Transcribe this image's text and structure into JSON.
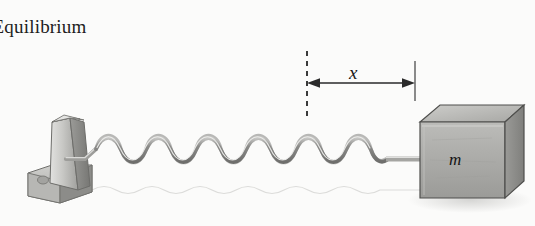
{
  "diagram": {
    "background_color": "#fbfbfa",
    "labels": {
      "equilibrium": "Equilibrium",
      "displacement": "x",
      "mass": "m"
    },
    "annotations": {
      "equilibrium_line_style": "dashed",
      "boundary_line_style": "solid",
      "arrow_style": "double-headed",
      "arrow_color": "#2a2a2a",
      "dashed_line_color": "#3a3a3a",
      "solid_line_color": "#8a8a8a"
    },
    "objects": {
      "wall_bracket": {
        "name": "wall-bracket",
        "fill_light": "#d6d6d4",
        "fill_mid": "#b5b5b2",
        "fill_dark": "#8f8f8c"
      },
      "spring": {
        "name": "coil-spring",
        "coils": 11,
        "stroke_color": "#7c7c7a",
        "highlight_color": "#d8d8d6"
      },
      "block": {
        "name": "mass-block",
        "top_face": "#b9b9b6",
        "front_face": "#a9a9a6",
        "side_face": "#8d8d8a",
        "outline": "#4a4a48",
        "shadow": "#dcdcda"
      },
      "ground_shadow": {
        "name": "ground-shadow",
        "color": "#dedede"
      }
    },
    "geometry": {
      "equilibrium_x": 307,
      "boundary_x": 415,
      "arrow_y": 83,
      "spring_left_x": 80,
      "spring_right_x": 395,
      "spring_center_y": 158
    }
  }
}
